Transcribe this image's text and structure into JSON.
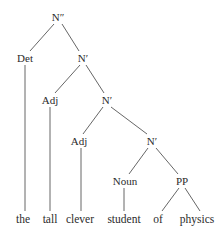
{
  "diagram": {
    "type": "syntax-tree",
    "line_color": "#555555",
    "text_color": "#2b2b2b",
    "background": "#ffffff",
    "nodes": [
      {
        "id": "n2",
        "label": "N″",
        "x": 58,
        "y": 17,
        "kind": "phrase"
      },
      {
        "id": "det",
        "label": "Det",
        "x": 25,
        "y": 58,
        "kind": "category"
      },
      {
        "id": "n1a",
        "label": "N′",
        "x": 83,
        "y": 58,
        "kind": "phrase"
      },
      {
        "id": "adj1",
        "label": "Adj",
        "x": 50,
        "y": 100,
        "kind": "category"
      },
      {
        "id": "n1b",
        "label": "N′",
        "x": 107,
        "y": 100,
        "kind": "phrase"
      },
      {
        "id": "adj2",
        "label": "Adj",
        "x": 79,
        "y": 141,
        "kind": "category"
      },
      {
        "id": "n1c",
        "label": "N′",
        "x": 152,
        "y": 141,
        "kind": "phrase"
      },
      {
        "id": "noun",
        "label": "Noun",
        "x": 125,
        "y": 181,
        "kind": "category"
      },
      {
        "id": "pp",
        "label": "PP",
        "x": 182,
        "y": 181,
        "kind": "phrase"
      },
      {
        "id": "w_the",
        "label": "the",
        "x": 23,
        "y": 219,
        "kind": "terminal"
      },
      {
        "id": "w_tall",
        "label": "tall",
        "x": 50,
        "y": 219,
        "kind": "terminal"
      },
      {
        "id": "w_clever",
        "label": "clever",
        "x": 80,
        "y": 219,
        "kind": "terminal"
      },
      {
        "id": "w_student",
        "label": "student",
        "x": 124,
        "y": 219,
        "kind": "terminal"
      },
      {
        "id": "w_of",
        "label": "of",
        "x": 158,
        "y": 219,
        "kind": "terminal"
      },
      {
        "id": "w_physics",
        "label": "physics",
        "x": 197,
        "y": 219,
        "kind": "terminal"
      }
    ],
    "edges": [
      {
        "from": "n2",
        "to": "det",
        "x1": 54,
        "y1": 24,
        "x2": 30,
        "y2": 51
      },
      {
        "from": "n2",
        "to": "n1a",
        "x1": 62,
        "y1": 24,
        "x2": 79,
        "y2": 51
      },
      {
        "from": "det",
        "to": "w_the",
        "x1": 25,
        "y1": 65,
        "x2": 25,
        "y2": 211
      },
      {
        "from": "n1a",
        "to": "adj1",
        "x1": 80,
        "y1": 65,
        "x2": 55,
        "y2": 93
      },
      {
        "from": "n1a",
        "to": "n1b",
        "x1": 86,
        "y1": 65,
        "x2": 104,
        "y2": 93
      },
      {
        "from": "adj1",
        "to": "w_tall",
        "x1": 50,
        "y1": 107,
        "x2": 50,
        "y2": 211
      },
      {
        "from": "n1b",
        "to": "adj2",
        "x1": 103,
        "y1": 107,
        "x2": 83,
        "y2": 134
      },
      {
        "from": "n1b",
        "to": "n1c",
        "x1": 111,
        "y1": 107,
        "x2": 147,
        "y2": 134
      },
      {
        "from": "adj2",
        "to": "w_clever",
        "x1": 81,
        "y1": 148,
        "x2": 81,
        "y2": 211
      },
      {
        "from": "n1c",
        "to": "noun",
        "x1": 148,
        "y1": 148,
        "x2": 129,
        "y2": 174
      },
      {
        "from": "n1c",
        "to": "pp",
        "x1": 156,
        "y1": 148,
        "x2": 178,
        "y2": 174
      },
      {
        "from": "noun",
        "to": "w_student",
        "x1": 124,
        "y1": 188,
        "x2": 124,
        "y2": 211
      },
      {
        "from": "pp",
        "to": "w_of",
        "x1": 179,
        "y1": 188,
        "x2": 162,
        "y2": 211
      },
      {
        "from": "pp",
        "to": "w_physics",
        "x1": 185,
        "y1": 188,
        "x2": 200,
        "y2": 211
      }
    ],
    "sentence": "the tall clever student of physics"
  }
}
